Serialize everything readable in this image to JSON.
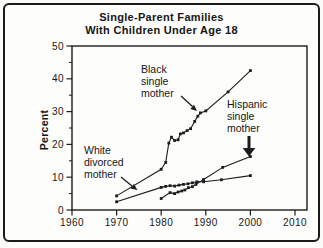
{
  "title": {
    "line1": "Single-Parent Families",
    "line2": "With Children Under Age 18"
  },
  "chart_data": {
    "type": "line",
    "title": "Single-Parent Families With Children Under Age 18",
    "xlabel": "",
    "ylabel": "Percent",
    "xlim": [
      1960,
      2010
    ],
    "ylim": [
      0,
      50
    ],
    "x_ticks": [
      1960,
      1970,
      1980,
      1990,
      2000,
      2010
    ],
    "y_ticks": [
      0,
      10,
      20,
      30,
      40,
      50
    ],
    "y_minor_ticks": [
      5,
      15,
      25,
      35,
      45
    ],
    "grid": false,
    "legend_position": "annotations-on-plot",
    "line_color": "#1c1c1c",
    "marker": "square",
    "series": [
      {
        "name": "Black single mother",
        "points": [
          [
            1970,
            4.3
          ],
          [
            1980,
            12.4
          ],
          [
            1981,
            14.5
          ],
          [
            1981.7,
            20.4
          ],
          [
            1982.3,
            22.2
          ],
          [
            1983,
            21.2
          ],
          [
            1983.8,
            21.4
          ],
          [
            1984.3,
            23.2
          ],
          [
            1985,
            23.5
          ],
          [
            1985.8,
            24.2
          ],
          [
            1986.6,
            24.8
          ],
          [
            1987.5,
            27.0
          ],
          [
            1988.2,
            28.6
          ],
          [
            1988.8,
            29.6
          ],
          [
            1990,
            30.2
          ],
          [
            1995,
            36.0
          ],
          [
            2000,
            42.5
          ]
        ]
      },
      {
        "name": "White divorced mother",
        "points": [
          [
            1970,
            2.5
          ],
          [
            1980,
            6.9
          ],
          [
            1981,
            7.2
          ],
          [
            1982,
            7.4
          ],
          [
            1983,
            7.3
          ],
          [
            1984,
            7.6
          ],
          [
            1985,
            7.8
          ],
          [
            1986,
            8.0
          ],
          [
            1987,
            8.3
          ],
          [
            1988,
            8.6
          ],
          [
            1989.5,
            8.6
          ],
          [
            1993.5,
            9.2
          ],
          [
            2000,
            10.5
          ]
        ]
      },
      {
        "name": "Hispanic single mother",
        "points": [
          [
            1980,
            3.5
          ],
          [
            1982,
            5.3
          ],
          [
            1983,
            5.0
          ],
          [
            1983.8,
            5.5
          ],
          [
            1984.6,
            5.8
          ],
          [
            1985.3,
            6.1
          ],
          [
            1986.1,
            6.8
          ],
          [
            1987,
            7.1
          ],
          [
            1987.8,
            7.8
          ],
          [
            1989.5,
            9.3
          ],
          [
            1993.8,
            13.0
          ],
          [
            2000,
            16.3
          ]
        ]
      }
    ],
    "annotations": [
      {
        "label": "Black single mother",
        "lines": [
          "Black",
          "single",
          "mother"
        ],
        "arrow_target": {
          "year": 1989,
          "value": 29.6
        }
      },
      {
        "label": "Hispanic single mother",
        "lines": [
          "Hispanic",
          "single",
          "mother"
        ],
        "arrow_target": {
          "year": 2000,
          "value": 16.3
        }
      },
      {
        "label": "White divorced mother",
        "lines": [
          "White",
          "divorced",
          "mother"
        ],
        "arrow_target": {
          "year": 1975,
          "value": 5.5
        }
      }
    ]
  }
}
